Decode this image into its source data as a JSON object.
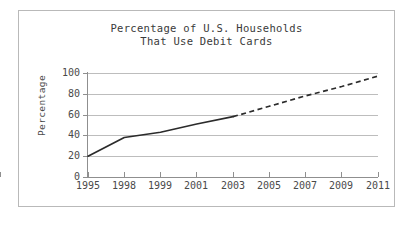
{
  "figure": {
    "title_line1": "Percentage of U.S. Households",
    "title_line2": "That Use Debit Cards",
    "border_color": "#b9b9b9",
    "background_color": "#ffffff"
  },
  "axes": {
    "y_axis_title": "Percentage",
    "y_tick_labels": [
      "100",
      "80",
      "60",
      "40",
      "20",
      "0"
    ],
    "x_tick_labels": [
      "1995",
      "1998",
      "1999",
      "2001",
      "2003",
      "2005",
      "2007",
      "2009",
      "2011"
    ],
    "gridline_color": "#bdbdbd",
    "axis_color": "#8f8f8f",
    "tick_label_color": "#4a4a4a"
  },
  "chart_data": {
    "type": "line",
    "title": "Percentage of U.S. Households That Use Debit Cards",
    "xlabel": "",
    "ylabel": "Percentage",
    "ylim": [
      0,
      100
    ],
    "yticks": [
      0,
      20,
      40,
      60,
      80,
      100
    ],
    "grid": true,
    "legend": "none",
    "categories": [
      "1995",
      "1998",
      "1999",
      "2001",
      "2003",
      "2005",
      "2007",
      "2009",
      "2011"
    ],
    "series": [
      {
        "name": "Actual (solid)",
        "style": "solid",
        "color": "#2b2b2b",
        "x": [
          "1995",
          "1998",
          "1999",
          "2001",
          "2003"
        ],
        "values": [
          20,
          38,
          43,
          51,
          58
        ]
      },
      {
        "name": "Projected (dashed)",
        "style": "dashed",
        "color": "#2b2b2b",
        "x": [
          "2003",
          "2005",
          "2007",
          "2009",
          "2011"
        ],
        "values": [
          58,
          68,
          78,
          87,
          97
        ]
      }
    ]
  }
}
